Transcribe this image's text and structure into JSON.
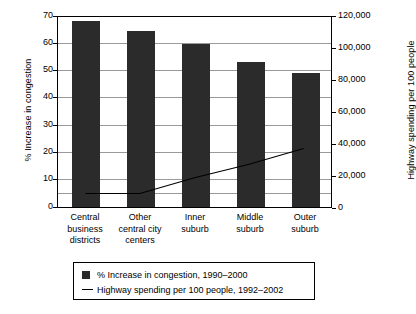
{
  "chart_data": {
    "type": "bar",
    "title": "",
    "subtitle": "",
    "categories": [
      "Central\nbusiness\ndistricts",
      "Other\ncentral city\ncenters",
      "Inner\nsuburb",
      "Middle\nsuburb",
      "Outer\nsuburb"
    ],
    "series": [
      {
        "name": "% Increase in congestion, 1990–2000",
        "type": "bar",
        "axis": "left",
        "values": [
          68,
          64,
          59.5,
          53,
          48.8
        ],
        "color": "#2b2b2b"
      },
      {
        "name": "Highway spending per 100 people, 1992–2002",
        "type": "line",
        "axis": "right",
        "values": [
          8500,
          8500,
          18500,
          27000,
          37000
        ],
        "color": "#000000"
      }
    ],
    "xlabel": "",
    "ylabel": "% Increase in congestion",
    "y2label": "Highway spending per 100 people",
    "ylim": [
      0,
      70
    ],
    "y2lim": [
      0,
      120000
    ],
    "yticks": [
      "0",
      "10",
      "20",
      "30",
      "40",
      "50",
      "60",
      "70"
    ],
    "y2ticks": [
      "0",
      "20,000",
      "40,000",
      "60,000",
      "80,000",
      "100,000",
      "120,000"
    ],
    "grid": true,
    "legend_position": "bottom-center"
  },
  "axes": {
    "left_title": "% Increase in congestion",
    "right_title": "Highway spending per 100 people",
    "left_ticks": [
      "70",
      "60",
      "50",
      "40",
      "30",
      "20",
      "10",
      "0"
    ],
    "right_ticks": [
      "120,000",
      "100,000",
      "80,000",
      "60,000",
      "40,000",
      "20,000",
      "0"
    ]
  },
  "legend": {
    "items": [
      {
        "marker": "square-swatch",
        "label": "% Increase in congestion, 1990–2000"
      },
      {
        "marker": "line-swatch",
        "label": "Highway spending per 100 people, 1992–2002"
      }
    ]
  },
  "colors": {
    "bar": "#2b2b2b",
    "line": "#000000",
    "grid": "#9a9a9a",
    "frame": "#000000",
    "background": "#ffffff"
  }
}
